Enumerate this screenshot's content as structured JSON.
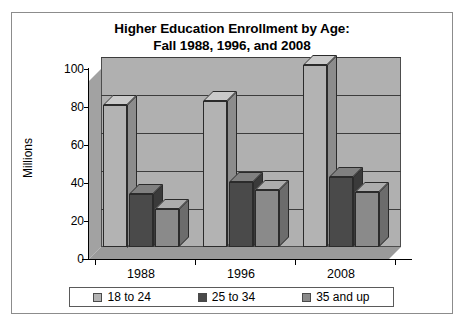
{
  "chart_data": {
    "type": "bar",
    "title": "Higher Education Enrollment by Age: Fall 1988, 1996, and 2008",
    "title_lines": [
      "Higher Education Enrollment by Age:",
      "Fall 1988, 1996, and 2008"
    ],
    "xlabel": "",
    "ylabel": "Millions",
    "categories": [
      "1988",
      "1996",
      "2008"
    ],
    "series": [
      {
        "name": "18 to 24",
        "values": [
          75,
          77,
          96
        ],
        "color": "#b3b3b3"
      },
      {
        "name": "25 to 34",
        "values": [
          28,
          34,
          37
        ],
        "color": "#4a4a4a"
      },
      {
        "name": "35 and up",
        "values": [
          20,
          30,
          29
        ],
        "color": "#8a8a8a"
      }
    ],
    "ylim": [
      0,
      100
    ],
    "yticks": [
      0,
      20,
      40,
      60,
      80,
      100
    ],
    "ytick_labels": [
      "0",
      "20",
      "40",
      "60",
      "80",
      "100"
    ],
    "grid": true,
    "legend_position": "bottom",
    "style": "3d-column"
  },
  "legend": {
    "items": [
      {
        "label": "18 to 24",
        "color": "#b3b3b3"
      },
      {
        "label": "25 to 34",
        "color": "#4a4a4a"
      },
      {
        "label": "35 and up",
        "color": "#8a8a8a"
      }
    ]
  },
  "colors": {
    "plot_back_wall": "#b0b0b0",
    "plot_floor": "#9a9a9a",
    "frame_border": "#8c8c8c",
    "axis": "#000000",
    "gridline": "#3c3c3c"
  }
}
